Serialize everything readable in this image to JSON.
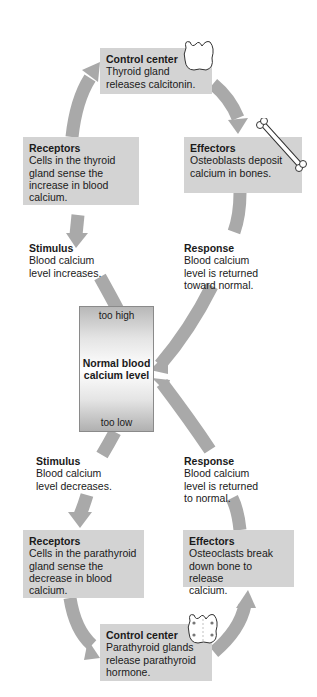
{
  "colors": {
    "box_fill": "#d3d3d3",
    "arrow": "#a9a9a9",
    "text": "#1a1a1a"
  },
  "top_loop": {
    "control_center": {
      "title": "Control center",
      "lines": [
        "Thyroid gland",
        "releases calcitonin."
      ],
      "icon": "thyroid-gland-icon"
    },
    "effectors": {
      "title": "Effectors",
      "lines": [
        "Osteoblasts deposit",
        "calcium in bones."
      ],
      "icon": "bone-icon"
    },
    "receptors": {
      "title": "Receptors",
      "lines": [
        "Cells in the thyroid",
        "gland sense the",
        "increase in blood",
        "calcium."
      ]
    },
    "stimulus": {
      "title": "Stimulus",
      "lines": [
        "Blood calcium",
        "level increases."
      ]
    },
    "response": {
      "title": "Response",
      "lines": [
        "Blood calcium",
        "level is returned",
        "toward normal."
      ]
    }
  },
  "center": {
    "top_label": "too high",
    "main_lines": [
      "Normal blood",
      "calcium level"
    ],
    "bottom_label": "too low"
  },
  "bottom_loop": {
    "stimulus": {
      "title": "Stimulus",
      "lines": [
        "Blood calcium",
        "level decreases."
      ]
    },
    "response": {
      "title": "Response",
      "lines": [
        "Blood calcium",
        "level is returned",
        "to normal."
      ]
    },
    "receptors": {
      "title": "Receptors",
      "lines": [
        "Cells in the parathyroid",
        "gland sense the",
        "decrease in blood",
        "calcium."
      ]
    },
    "effectors": {
      "title": "Effectors",
      "lines": [
        "Osteoclasts break",
        "down bone to release",
        "calcium."
      ]
    },
    "control_center": {
      "title": "Control center",
      "lines": [
        "Parathyroid glands",
        "release parathyroid",
        "hormone."
      ],
      "icon": "parathyroid-glands-icon"
    }
  }
}
